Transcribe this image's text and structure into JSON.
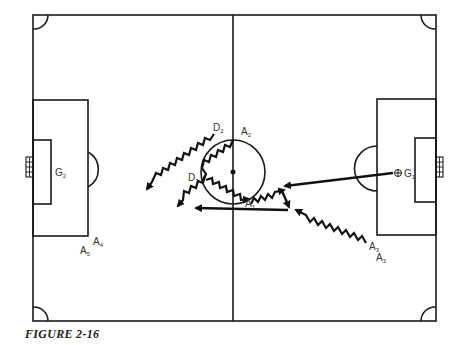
{
  "figure": {
    "caption": "FIGURE 2-16",
    "type": "soccer field tactical diagram",
    "colors": {
      "lines": "#1a1a1a",
      "background": "#ffffff",
      "labels": "#333333"
    }
  },
  "players": {
    "D1": {
      "letter": "D",
      "sub": "1"
    },
    "D2": {
      "letter": "D",
      "sub": "2"
    },
    "A1": {
      "letter": "A",
      "sub": "1"
    },
    "A2": {
      "letter": "A",
      "sub": "2"
    },
    "A3": {
      "letter": "A",
      "sub": "3"
    },
    "A3b": {
      "letter": "A",
      "sub": "3"
    },
    "A4": {
      "letter": "A",
      "sub": "4"
    },
    "A5": {
      "letter": "A",
      "sub": "5"
    },
    "G1": {
      "letter": "G",
      "sub": "1"
    },
    "G2": {
      "letter": "G",
      "sub": "2"
    }
  },
  "legend": {
    "straight_arrow": "pass",
    "zigzag_arrow": "dribble / run"
  }
}
